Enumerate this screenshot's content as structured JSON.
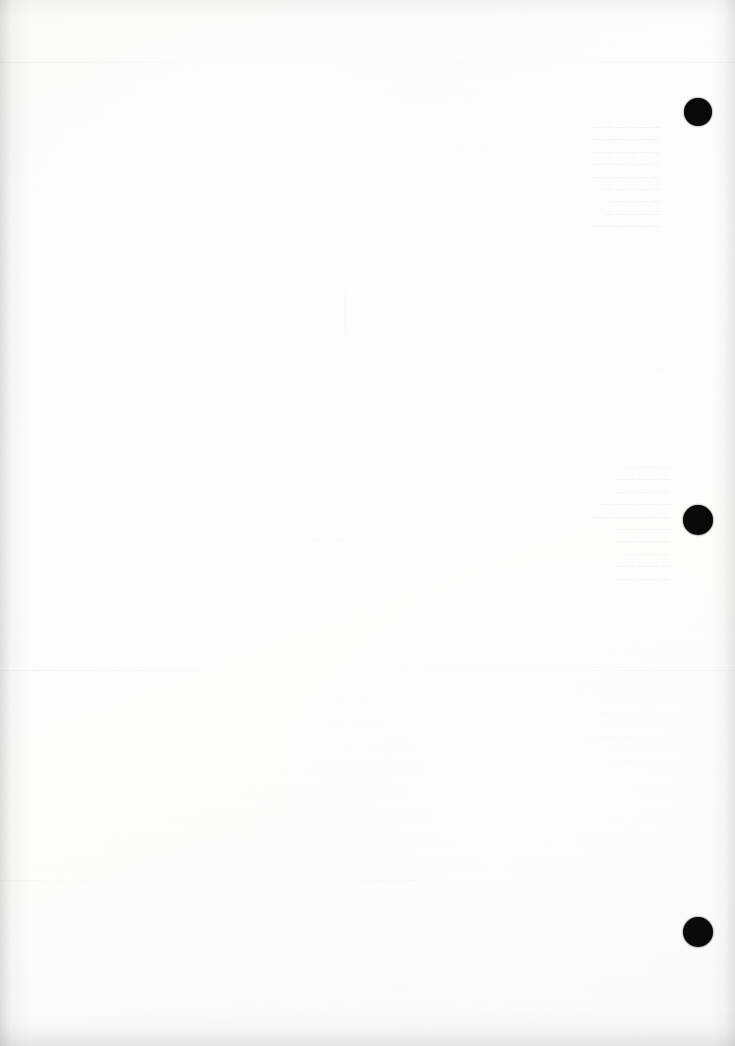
{
  "page": {
    "width_px": 735,
    "height_px": 1046,
    "paper_color": "#fdfdfd",
    "ink_color": "#0a0a0a",
    "content_summary": "Blank reverse side of a scanned printed sheet. No legible foreground text; only faint mirrored show-through ink from the opposite face, two horizontal crease lines, a short vertical rule, and three solid black registration punch marks down the right margin."
  },
  "marks": {
    "registration_marks": [
      {
        "name": "punch-mark-top",
        "cx": 698,
        "cy": 112,
        "r": 14,
        "color": "#0a0a0a"
      },
      {
        "name": "punch-mark-middle",
        "cx": 698,
        "cy": 520,
        "r": 15,
        "color": "#0a0a0a"
      },
      {
        "name": "punch-mark-bottom",
        "cx": 698,
        "cy": 932,
        "r": 15,
        "color": "#0a0a0a"
      }
    ]
  },
  "rules": {
    "horizontal": [
      {
        "name": "crease-line-upper",
        "x": 0,
        "y": 62,
        "width": 735,
        "opacity": 0.3
      },
      {
        "name": "crease-line-lower",
        "x": 0,
        "y": 670,
        "width": 735,
        "opacity": 0.26
      },
      {
        "name": "crease-line-foot",
        "x": 0,
        "y": 880,
        "width": 415,
        "opacity": 0.16
      }
    ],
    "vertical": [
      {
        "name": "short-vertical-rule",
        "x": 345,
        "y": 291,
        "height": 50,
        "opacity": 0.3
      }
    ]
  },
  "showthrough": {
    "note": "Mirrored ghost ink visible through the paper from the printed recto. Rendered as reversed, heavily-lightened text blocks approximating the original line rhythm; individual glyphs are not legible in the scan.",
    "blocks": [
      {
        "name": "bleed-block-upper-left",
        "x": 62,
        "y": 150,
        "width": 300,
        "font_size": 9,
        "intensity": "faint",
        "text": "— — — — —  — — — —\n— — —   — — — — — —\n— — — — —  — —   — —\n—  — — — — — — —\n— — —  — — — — —  —"
      },
      {
        "name": "bleed-block-upper-mid",
        "x": 370,
        "y": 140,
        "width": 130,
        "font_size": 9,
        "intensity": "fainter",
        "text": "— — —  —\n— — — —\n—  — — —\n— — —"
      },
      {
        "name": "bleed-block-upper-right",
        "x": 500,
        "y": 120,
        "width": 160,
        "font_size": 9,
        "intensity": "strong",
        "text": "— — — — — —\n—  — — — — —\n— — — —  — —\n— — — — — —\n— —  — — — —\n— — — — —\n—  — — — —\n— — — —  —\n— — — — — —"
      },
      {
        "name": "bleed-block-mid-left",
        "x": 70,
        "y": 300,
        "width": 290,
        "font_size": 9,
        "intensity": "faint",
        "text": "— — — —  — — — —\n— —  — — — — — — —\n— — — — —  — —"
      },
      {
        "name": "bleed-block-mid-center",
        "x": 250,
        "y": 380,
        "width": 180,
        "font_size": 9,
        "intensity": "fainter",
        "text": "— — —  — —\n— — — — —\n—  — — —"
      },
      {
        "name": "bleed-block-mid-right",
        "x": 505,
        "y": 300,
        "width": 160,
        "font_size": 9,
        "intensity": "faint",
        "text": "— — — —  —\n— — — — — —\n—  — — — —\n— — — —\n— — —  — —\n— — — — —"
      },
      {
        "name": "bleed-block-center-right",
        "x": 495,
        "y": 460,
        "width": 175,
        "font_size": 9,
        "intensity": "strong",
        "text": "—  — — —\n— — — — —\n— — —  — —\n— — — — — —\n— — — — — — —\n—  — — — —\n— — —  — —\n— — — —\n— —  — — —\n— — — — —"
      },
      {
        "name": "bleed-block-lower-left",
        "x": 60,
        "y": 520,
        "width": 320,
        "font_size": 9,
        "intensity": "faint",
        "text": "— — —  — — — — —\n— — — — — —  — — —\n— —  — — — — — — —"
      },
      {
        "name": "bleed-block-lower-center",
        "x": 100,
        "y": 615,
        "width": 280,
        "font_size": 9,
        "intensity": "fainter",
        "text": "— — — —  — — —\n— — —  — — — — —"
      },
      {
        "name": "bleed-block-foot-left",
        "x": 150,
        "y": 690,
        "width": 230,
        "font_size": 9,
        "intensity": "fainter",
        "text": "— — — — — —\n— — —  — —\n— — — — —"
      },
      {
        "name": "bleed-block-foot-right",
        "x": 470,
        "y": 680,
        "width": 185,
        "font_size": 9,
        "intensity": "faint",
        "text": "— — — — — — —\n— — —  — —\n— — — — —\n— — —  — —\n— — — — — —\n—  — — —\n— — — —"
      },
      {
        "name": "bleed-block-bottom-note",
        "x": 280,
        "y": 930,
        "width": 170,
        "font_size": 9,
        "intensity": "fainter",
        "text": "— — — —  —\n— — — —"
      },
      {
        "name": "bleed-block-footer-left",
        "x": 100,
        "y": 998,
        "width": 180,
        "font_size": 8,
        "intensity": "fainter",
        "text": "— — — — — — —"
      },
      {
        "name": "bleed-block-footer-right",
        "x": 510,
        "y": 996,
        "width": 170,
        "font_size": 9,
        "intensity": "faint",
        "text": "— — — — — — — —"
      }
    ]
  }
}
